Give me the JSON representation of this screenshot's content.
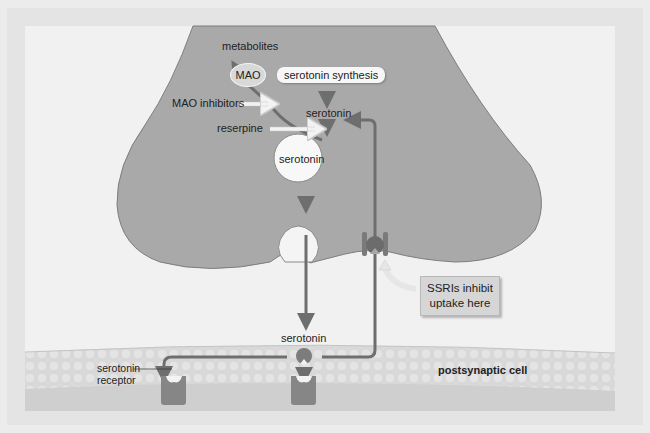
{
  "labels": {
    "metabolites": "metabolites",
    "mao": "MAO",
    "serotonin_synthesis": "serotonin synthesis",
    "mao_inhibitors": "MAO inhibitors",
    "serotonin_top": "serotonin",
    "reserpine": "reserpine",
    "serotonin_vesicle": "serotonin",
    "serotonin_cleft": "serotonin",
    "ssri_line1": "SSRIs inhibit",
    "ssri_line2": "uptake here",
    "receptor_line1": "serotonin",
    "receptor_line2": "receptor",
    "postsynaptic": "postsynaptic cell"
  },
  "colors": {
    "background_outer": "#ececec",
    "background_inner": "#f2f2f2",
    "neuron_fill": "#a9a9a9",
    "neuron_edge": "#7d7d7d",
    "arrow": "#6e6e6e",
    "receptor": "#8a8a8a",
    "membrane": "#dcdcdc",
    "vesicle": "#f8f8f8"
  }
}
